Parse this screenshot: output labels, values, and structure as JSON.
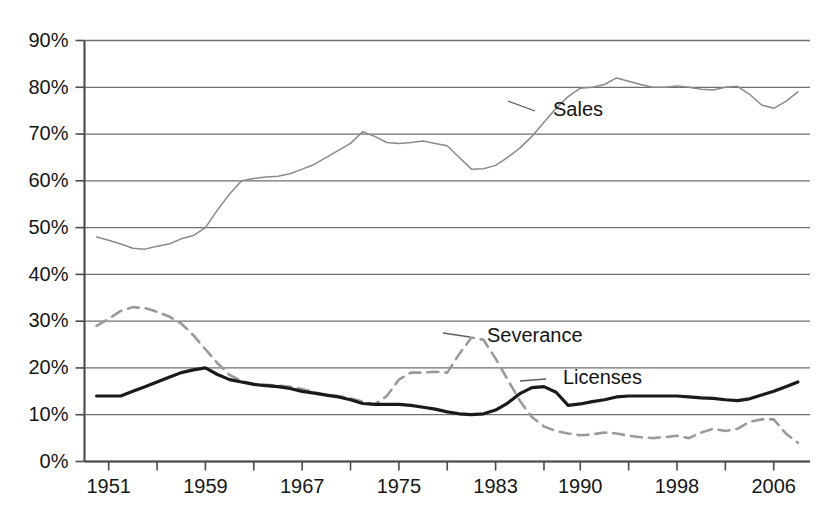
{
  "chart_data": {
    "type": "line",
    "title": "",
    "subtitle": "",
    "xlabel": "",
    "ylabel": "",
    "xlim": [
      1949,
      2009
    ],
    "ylim": [
      0,
      90
    ],
    "grid": true,
    "legend_position": "inline-annotations",
    "y_ticks": [
      "0%",
      "10%",
      "20%",
      "30%",
      "40%",
      "50%",
      "60%",
      "70%",
      "80%",
      "90%"
    ],
    "y_tick_values": [
      0,
      10,
      20,
      30,
      40,
      50,
      60,
      70,
      80,
      90
    ],
    "x_tick_labels": [
      "1951",
      "1959",
      "1967",
      "1975",
      "1983",
      "1990",
      "1998",
      "2006"
    ],
    "x_tick_values": [
      1951,
      1959,
      1967,
      1975,
      1983,
      1990,
      1998,
      2006
    ],
    "x_minor_ticks": [
      1951,
      1955,
      1959,
      1963,
      1967,
      1971,
      1975,
      1979,
      1983,
      1987,
      1990,
      1994,
      1998,
      2002,
      2006
    ],
    "x": [
      1950,
      1951,
      1952,
      1953,
      1954,
      1955,
      1956,
      1957,
      1958,
      1959,
      1960,
      1961,
      1962,
      1963,
      1964,
      1965,
      1966,
      1967,
      1968,
      1969,
      1970,
      1971,
      1972,
      1973,
      1974,
      1975,
      1976,
      1977,
      1978,
      1979,
      1980,
      1981,
      1982,
      1983,
      1984,
      1985,
      1986,
      1987,
      1988,
      1989,
      1990,
      1991,
      1992,
      1993,
      1994,
      1995,
      1996,
      1997,
      1998,
      1999,
      2000,
      2001,
      2002,
      2003,
      2004,
      2005,
      2006,
      2007,
      2008
    ],
    "series": [
      {
        "name": "Sales",
        "style": "thin-solid",
        "color": "#8a8a8a",
        "label_anchor_year": 1985,
        "label_anchor_value": 72,
        "values": [
          48.0,
          47.3,
          46.5,
          45.6,
          45.4,
          46.0,
          46.5,
          47.6,
          48.3,
          50.0,
          53.8,
          57.2,
          60.0,
          60.5,
          60.8,
          61.0,
          61.5,
          62.5,
          63.5,
          65.0,
          66.5,
          68.0,
          70.5,
          69.5,
          68.2,
          68.0,
          68.2,
          68.5,
          68.0,
          67.5,
          65.0,
          62.5,
          62.6,
          63.3,
          65.0,
          67.0,
          69.5,
          72.5,
          75.5,
          78.0,
          79.8,
          80.0,
          80.6,
          82.0,
          81.3,
          80.6,
          80.0,
          80.0,
          80.3,
          80.0,
          79.6,
          79.4,
          80.0,
          80.2,
          78.5,
          76.2,
          75.5,
          77.0,
          79.0
        ]
      },
      {
        "name": "Severance",
        "style": "dashed",
        "color": "#9a9a9a",
        "label_anchor_year": 1985,
        "label_anchor_value": 27,
        "values": [
          29.0,
          30.5,
          32.2,
          33.0,
          32.8,
          32.0,
          31.0,
          29.5,
          27.0,
          24.0,
          21.0,
          18.5,
          17.2,
          16.6,
          16.4,
          16.2,
          16.0,
          15.5,
          14.8,
          14.2,
          14.0,
          13.5,
          12.8,
          12.2,
          14.0,
          17.5,
          19.0,
          19.0,
          19.2,
          19.0,
          23.0,
          26.5,
          26.0,
          22.0,
          17.5,
          13.0,
          9.5,
          7.5,
          6.5,
          6.0,
          5.6,
          5.8,
          6.2,
          6.0,
          5.5,
          5.2,
          5.0,
          5.2,
          5.5,
          5.0,
          6.2,
          7.0,
          6.5,
          7.0,
          8.5,
          9.0,
          9.0,
          6.0,
          4.0
        ]
      },
      {
        "name": "Licenses",
        "style": "thick-solid",
        "color": "#1a1a1a",
        "label_anchor_year": 1993,
        "label_anchor_value": 16.5,
        "values": [
          14.0,
          14.0,
          14.0,
          15.0,
          16.0,
          17.0,
          18.0,
          19.0,
          19.6,
          20.0,
          18.6,
          17.5,
          17.0,
          16.5,
          16.2,
          16.0,
          15.6,
          15.0,
          14.6,
          14.2,
          13.8,
          13.2,
          12.4,
          12.2,
          12.2,
          12.2,
          12.0,
          11.6,
          11.2,
          10.6,
          10.2,
          10.0,
          10.2,
          11.0,
          12.5,
          14.5,
          15.8,
          16.0,
          14.8,
          12.0,
          12.3,
          12.8,
          13.2,
          13.8,
          14.0,
          14.0,
          14.0,
          14.0,
          14.0,
          13.8,
          13.6,
          13.5,
          13.2,
          13.0,
          13.4,
          14.2,
          15.0,
          16.0,
          17.0
        ]
      }
    ]
  },
  "labels": {
    "sales": "Sales",
    "severance": "Severance",
    "licenses": "Licenses"
  }
}
